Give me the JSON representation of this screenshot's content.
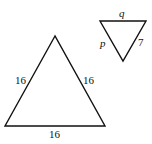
{
  "diagram": {
    "large_triangle": {
      "type": "equilateral",
      "sides": {
        "left": "16",
        "right": "16",
        "bottom": "16"
      },
      "vertices": [
        [
          55,
          36
        ],
        [
          5,
          126
        ],
        [
          105,
          126
        ]
      ]
    },
    "small_triangle": {
      "orientation": "inverted",
      "sides": {
        "top": "q",
        "left": "p",
        "right": "7"
      },
      "vertices": [
        [
          100,
          21
        ],
        [
          146,
          21
        ],
        [
          123,
          61
        ]
      ]
    },
    "stroke_color": "#111111",
    "background": "#ffffff"
  }
}
